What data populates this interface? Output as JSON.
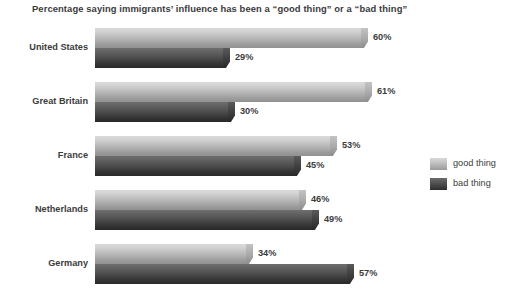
{
  "chart_data": {
    "type": "bar",
    "orientation": "horizontal",
    "title": "Percentage saying immigrants’ influence has been a “good thing” or a “bad thing”",
    "xlabel": "",
    "ylabel": "",
    "xlim": [
      0,
      70
    ],
    "grid": false,
    "legend_position": "right",
    "categories": [
      "United States",
      "Great Britain",
      "France",
      "Netherlands",
      "Germany"
    ],
    "series": [
      {
        "name": "good thing",
        "color": "#bfbfbf",
        "values": [
          60,
          61,
          53,
          46,
          34
        ],
        "labels": [
          "60%",
          "61%",
          "53%",
          "46%",
          "34%"
        ]
      },
      {
        "name": "bad thing",
        "color": "#3f3f3f",
        "values": [
          29,
          30,
          45,
          49,
          57
        ],
        "labels": [
          "29%",
          "30%",
          "45%",
          "49%",
          "57%"
        ]
      }
    ]
  },
  "legend": {
    "items": [
      {
        "label": "good thing",
        "swatch": "good"
      },
      {
        "label": "bad thing",
        "swatch": "bad"
      }
    ]
  }
}
